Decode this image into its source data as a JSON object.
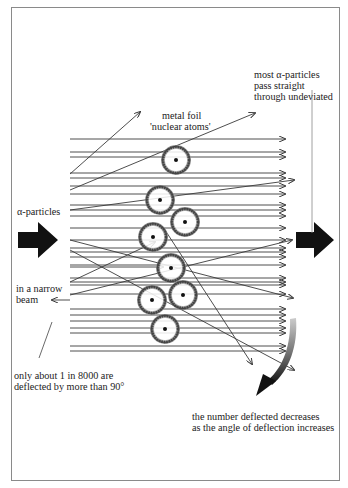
{
  "diagram": {
    "labels": {
      "metal_foil": "metal foil",
      "nuclear_atoms": "'nuclear atoms'",
      "alpha_particles": "α-particles",
      "narrow_beam_1": "in a narrow",
      "narrow_beam_2": "beam",
      "most_1": "most α-particles",
      "most_2": "pass straight",
      "most_3": "through undeviated",
      "only_1": "only about 1 in 8000 are",
      "only_2": "deflected by more than 90°",
      "number_1": "the number deflected decreases",
      "number_2": "as the angle of deflection increases"
    },
    "colors": {
      "line": "#3a3a3a",
      "arrow_fill": "#111111",
      "frame": "#8a8a8a",
      "atom_ring": "#444444"
    },
    "beam_lines_y": [
      139,
      152,
      157,
      173,
      178,
      186,
      194,
      205,
      210,
      216,
      228,
      240,
      248,
      252,
      257,
      265,
      278,
      282,
      285,
      294,
      309,
      315,
      321,
      328,
      333,
      346,
      351
    ],
    "beam_x_start": 70,
    "beam_x_end": 285,
    "atoms": [
      {
        "cx": 176,
        "cy": 160
      },
      {
        "cx": 160,
        "cy": 200
      },
      {
        "cx": 185,
        "cy": 222
      },
      {
        "cx": 153,
        "cy": 237
      },
      {
        "cx": 171,
        "cy": 268
      },
      {
        "cx": 183,
        "cy": 295
      },
      {
        "cx": 152,
        "cy": 300
      },
      {
        "cx": 165,
        "cy": 329
      }
    ],
    "deflected_paths": [
      [
        70,
        174,
        140,
        112
      ],
      [
        70,
        190,
        255,
        113
      ],
      [
        70,
        210,
        294,
        180
      ],
      [
        70,
        282,
        155,
        242
      ],
      [
        70,
        267,
        163,
        267
      ],
      [
        70,
        250,
        294,
        370
      ],
      [
        70,
        240,
        293,
        298
      ],
      [
        70,
        295,
        292,
        240
      ],
      [
        165,
        230,
        252,
        364
      ],
      [
        70,
        300,
        52,
        300
      ]
    ]
  }
}
